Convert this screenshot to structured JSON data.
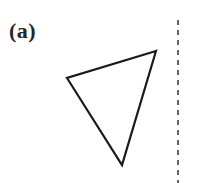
{
  "figure": {
    "panel_label": "(a)",
    "width": 219,
    "height": 183,
    "background_color": "#ffffff"
  },
  "chart_data": {
    "type": "diagram",
    "title": "(a)",
    "subtitle": "",
    "xlabel": "",
    "ylabel": "",
    "grid": false,
    "legend": "none",
    "axis_ranges": {
      "x": [
        0,
        219
      ],
      "y": [
        0,
        183
      ]
    },
    "annotations": [
      {
        "name": "panel-label",
        "text": "(a)",
        "x": 10,
        "y": 32,
        "style": "bold-serif",
        "color": "#262626",
        "font_size": 22
      }
    ],
    "shapes": [
      {
        "name": "triangle",
        "type": "polygon",
        "closed": true,
        "fill": "none",
        "stroke": "#1a1a1a",
        "stroke_width": 2.2,
        "vertices": [
          {
            "label": "top-right",
            "x": 156,
            "y": 51
          },
          {
            "label": "left",
            "x": 67,
            "y": 78
          },
          {
            "label": "bottom",
            "x": 122,
            "y": 165
          }
        ]
      },
      {
        "name": "mirror-axis",
        "type": "line",
        "orientation": "vertical",
        "stroke": "#3d3d3d",
        "stroke_width": 1.6,
        "dash_pattern": [
          5,
          5
        ],
        "x1": 178,
        "y1": 20,
        "x2": 178,
        "y2": 183
      }
    ]
  }
}
